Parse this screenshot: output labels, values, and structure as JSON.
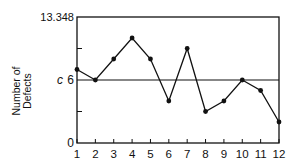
{
  "chart_data": {
    "type": "line",
    "title": "",
    "xlabel": "",
    "ylabel": "Number of Defects",
    "ylabel_lines": [
      "Number of",
      "Defects"
    ],
    "x": [
      1,
      2,
      3,
      4,
      5,
      6,
      7,
      8,
      9,
      10,
      11,
      12
    ],
    "series": [
      {
        "name": "Number of Defects",
        "values": [
          7,
          6,
          8,
          10,
          8,
          4,
          9,
          3,
          4,
          6,
          5,
          2
        ]
      }
    ],
    "x_ticks": [
      "1",
      "2",
      "3",
      "4",
      "5",
      "6",
      "7",
      "8",
      "9",
      "10",
      "11",
      "12"
    ],
    "y_tick_labels": [
      {
        "value": 0,
        "label": "0"
      },
      {
        "value": 6,
        "label": "6"
      },
      {
        "value": 13.348,
        "label": "13.348"
      }
    ],
    "y_minor_ticks": [
      3,
      9
    ],
    "center_line": {
      "value": 6,
      "label": "c"
    },
    "upper_control_limit": 13.348,
    "ylim": [
      0,
      13.348
    ],
    "xlim": [
      1,
      12
    ],
    "grid": false,
    "legend": null,
    "colors": {
      "line": "#111111",
      "background": "#ffffff"
    }
  }
}
